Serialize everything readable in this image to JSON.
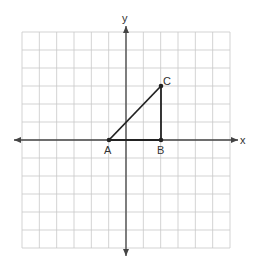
{
  "diagram": {
    "type": "coordinate-plane",
    "axes": {
      "x_label": "x",
      "y_label": "y",
      "x_range": [
        -6,
        6
      ],
      "y_range": [
        -6,
        6
      ],
      "grid": true
    },
    "points": [
      {
        "name": "A",
        "x": -1,
        "y": 0
      },
      {
        "name": "B",
        "x": 2,
        "y": 0
      },
      {
        "name": "C",
        "x": 2,
        "y": 3
      }
    ],
    "segments": [
      [
        "A",
        "C"
      ],
      [
        "C",
        "B"
      ],
      [
        "A",
        "B"
      ]
    ],
    "colors": {
      "grid": "#c8c8c8",
      "axis": "#444444",
      "shape": "#222222"
    }
  }
}
